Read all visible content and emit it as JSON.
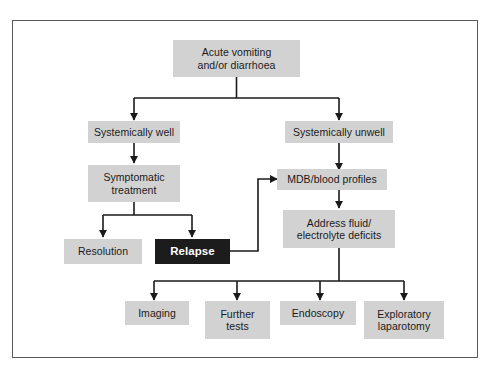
{
  "diagram": {
    "type": "flowchart",
    "colors": {
      "node_fill": "#d2d2d2",
      "node_text": "#1a1a1a",
      "highlight_fill": "#1c1c1c",
      "highlight_text": "#ffffff",
      "connector": "#1a1a1a",
      "frame_border": "#5a5a5a",
      "background": "#ffffff"
    },
    "nodes": [
      {
        "id": "start",
        "label": "Acute vomiting\nand/or diarrhoea",
        "line1": "Acute vomiting",
        "line2": "and/or diarrhoea",
        "style": "normal"
      },
      {
        "id": "well",
        "label": "Systemically well",
        "line1": "Systemically well",
        "line2": "",
        "style": "normal"
      },
      {
        "id": "unwell",
        "label": "Systemically unwell",
        "line1": "Systemically unwell",
        "line2": "",
        "style": "normal"
      },
      {
        "id": "symptomatic",
        "label": "Symptomatic\ntreatment",
        "line1": "Symptomatic",
        "line2": "treatment",
        "style": "normal"
      },
      {
        "id": "mdb",
        "label": "MDB/blood profiles",
        "line1": "MDB/blood profiles",
        "line2": "",
        "style": "normal"
      },
      {
        "id": "resolution",
        "label": "Resolution",
        "line1": "Resolution",
        "line2": "",
        "style": "normal"
      },
      {
        "id": "relapse",
        "label": "Relapse",
        "line1": "Relapse",
        "line2": "",
        "style": "highlight"
      },
      {
        "id": "fluids",
        "label": "Address fluid/\nelectrolyte deficits",
        "line1": "Address fluid/",
        "line2": "electrolyte deficits",
        "style": "normal"
      },
      {
        "id": "imaging",
        "label": "Imaging",
        "line1": "Imaging",
        "line2": "",
        "style": "normal"
      },
      {
        "id": "further",
        "label": "Further\ntests",
        "line1": "Further",
        "line2": "tests",
        "style": "normal"
      },
      {
        "id": "endoscopy",
        "label": "Endoscopy",
        "line1": "Endoscopy",
        "line2": "",
        "style": "normal"
      },
      {
        "id": "laparotomy",
        "label": "Exploratory\nlaparotomy",
        "line1": "Exploratory",
        "line2": "laparotomy",
        "style": "normal"
      }
    ],
    "edges": [
      {
        "from": "start",
        "to": "well",
        "kind": "split"
      },
      {
        "from": "start",
        "to": "unwell",
        "kind": "split"
      },
      {
        "from": "well",
        "to": "symptomatic",
        "kind": "straight"
      },
      {
        "from": "unwell",
        "to": "mdb",
        "kind": "straight"
      },
      {
        "from": "symptomatic",
        "to": "resolution",
        "kind": "split"
      },
      {
        "from": "symptomatic",
        "to": "relapse",
        "kind": "split"
      },
      {
        "from": "relapse",
        "to": "mdb",
        "kind": "feedback"
      },
      {
        "from": "mdb",
        "to": "fluids",
        "kind": "straight"
      },
      {
        "from": "fluids",
        "to": "imaging",
        "kind": "split"
      },
      {
        "from": "fluids",
        "to": "further",
        "kind": "split"
      },
      {
        "from": "fluids",
        "to": "endoscopy",
        "kind": "split"
      },
      {
        "from": "fluids",
        "to": "laparotomy",
        "kind": "split"
      }
    ]
  }
}
